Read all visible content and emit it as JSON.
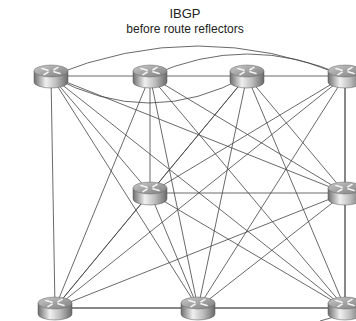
{
  "title": {
    "main": "IBGP",
    "subtitle": "before route reflectors"
  },
  "nodes": [
    {
      "id": "r1",
      "label": "router-top-left",
      "x": 51,
      "y": 76
    },
    {
      "id": "r2",
      "label": "router-top-center-left",
      "x": 150,
      "y": 76
    },
    {
      "id": "r3",
      "label": "router-top-center-right",
      "x": 247,
      "y": 76
    },
    {
      "id": "r4",
      "label": "router-top-right",
      "x": 345,
      "y": 76
    },
    {
      "id": "r5",
      "label": "router-middle-center",
      "x": 150,
      "y": 193
    },
    {
      "id": "r6",
      "label": "router-middle-right",
      "x": 345,
      "y": 193
    },
    {
      "id": "r7",
      "label": "router-bottom-left",
      "x": 55,
      "y": 308
    },
    {
      "id": "r8",
      "label": "router-bottom-center",
      "x": 198,
      "y": 308
    },
    {
      "id": "r9",
      "label": "router-bottom-right",
      "x": 345,
      "y": 308
    }
  ],
  "topology": "full-mesh",
  "colors": {
    "line": "#444444",
    "router_body_light": "#e6e6e6",
    "router_body_dark": "#7a7a7a",
    "router_top": "#9a9a9a"
  }
}
